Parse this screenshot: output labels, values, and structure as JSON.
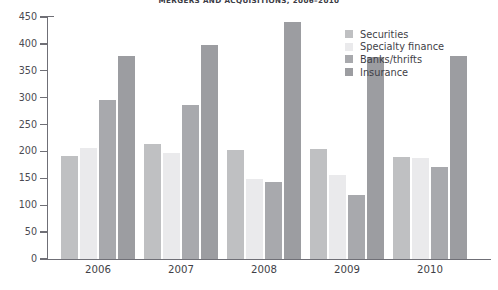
{
  "chart_data": {
    "type": "bar",
    "title": "MERGERS AND ACQUISITIONS, 2006–2010",
    "xlabel": "",
    "ylabel": "",
    "ylim": [
      0,
      450
    ],
    "yticks": [
      0,
      50,
      100,
      150,
      200,
      250,
      300,
      350,
      400,
      450
    ],
    "grid": false,
    "legend_position": "top-right",
    "categories": [
      "2006",
      "2007",
      "2008",
      "2009",
      "2010"
    ],
    "series": [
      {
        "name": "Securities",
        "color": "#bfc0c2",
        "values": [
          192,
          214,
          203,
          205,
          189
        ]
      },
      {
        "name": "Specialty finance",
        "color": "#eaeaec",
        "values": [
          207,
          198,
          148,
          156,
          188
        ]
      },
      {
        "name": "Banks/thrifts",
        "color": "#a8a9ad",
        "values": [
          295,
          287,
          143,
          119,
          172
        ]
      },
      {
        "name": "Insurance",
        "color": "#9c9da1",
        "values": [
          378,
          398,
          440,
          375,
          377
        ]
      }
    ]
  }
}
